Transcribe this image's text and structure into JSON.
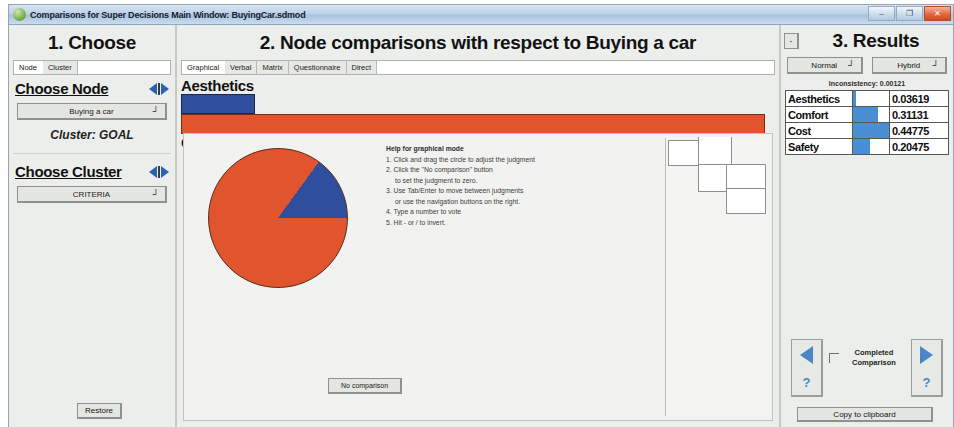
{
  "window": {
    "title": "Comparisons for Super Decisions Main Window: BuyingCar.sdmod",
    "minimize_label": "–",
    "maximize_label": "❐",
    "close_label": "✕"
  },
  "left": {
    "heading": "1. Choose",
    "tabs": [
      {
        "label": "Node",
        "active": true
      },
      {
        "label": "Cluster",
        "active": false
      }
    ],
    "choose_node_label": "Choose Node",
    "node_value": "Buying a car",
    "cluster_line": "Cluster: GOAL",
    "choose_cluster_label": "Choose Cluster",
    "cluster_value": "CRITERIA",
    "restore_label": "Restore",
    "dropdown_arrow": "┘"
  },
  "center": {
    "heading": "2. Node comparisons with respect to Buying a car",
    "tabs": [
      {
        "label": "Graphical",
        "active": true
      },
      {
        "label": "Verbal",
        "active": false
      },
      {
        "label": "Matrix",
        "active": false
      },
      {
        "label": "Questionnaire",
        "active": false
      },
      {
        "label": "Direct",
        "active": false
      }
    ],
    "no_comparison_label": "No comparison",
    "help": {
      "title": "Help for graphical mode",
      "lines": [
        "1. Click and drag the circle to adjust the judgment",
        "2. Click the \"No comparison\" button",
        "to set the judgment to zero.",
        "3. Use Tab/Enter to move between judgments",
        "or use the navigation buttons on the right.",
        "4. Type a number to vote",
        "5. Hit - or / to invert."
      ]
    }
  },
  "right": {
    "heading": "3. Results",
    "dot_label": "·",
    "normal_label": "Normal",
    "hybrid_label": "Hybrid",
    "dropdown_arrow": "┘",
    "inconsistency": "Inconsistency: 0.00121",
    "rows": [
      {
        "name": "Aesthetics",
        "value": "0.03619"
      },
      {
        "name": "Comfort",
        "value": "0.31131"
      },
      {
        "name": "Cost",
        "value": "0.44775"
      },
      {
        "name": "Safety",
        "value": "0.20475"
      }
    ],
    "completed_label": "Completed\nComparison",
    "copy_label": "Copy to clipboard",
    "qmark": "?"
  },
  "chart_data": [
    {
      "type": "bar",
      "title": "Node comparison bars",
      "orientation": "horizontal",
      "categories": [
        "Aesthetics",
        "Cost"
      ],
      "values": [
        0.127,
        1.0
      ],
      "colors": [
        "#2f4f9e",
        "#e0542e"
      ],
      "xlabel": "",
      "ylabel": ""
    },
    {
      "type": "pie",
      "title": "Judgment pie",
      "labels": [
        "Cost",
        "Aesthetics"
      ],
      "values": [
        0.85,
        0.15
      ],
      "colors": [
        "#e0542e",
        "#2f4f9e"
      ]
    },
    {
      "type": "bar",
      "title": "Results priorities",
      "orientation": "horizontal",
      "categories": [
        "Aesthetics",
        "Comfort",
        "Cost",
        "Safety"
      ],
      "values": [
        0.03619,
        0.31131,
        0.44775,
        0.20475
      ],
      "ylim": [
        0,
        0.44775
      ],
      "colors": [
        "#4a8fd6",
        "#4a8fd6",
        "#4a8fd6",
        "#4a8fd6"
      ]
    }
  ]
}
